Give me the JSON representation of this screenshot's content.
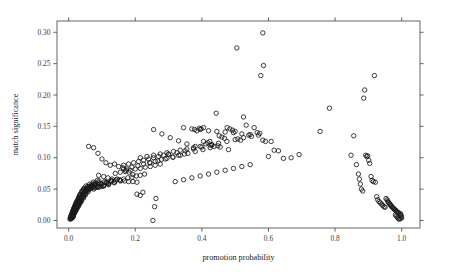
{
  "figure": {
    "background_color": "#ffffff",
    "frame_color": "#555555",
    "point_color": "#1a1a1a",
    "width": 449,
    "height": 278
  },
  "chart_data": {
    "type": "scatter",
    "title": "",
    "subtitle": "",
    "xlabel": "promotion probability",
    "ylabel": "match significance",
    "xlim": [
      -0.035,
      1.055
    ],
    "ylim": [
      -0.012,
      0.318
    ],
    "xticks": [
      0.0,
      0.2,
      0.4,
      0.6,
      0.8,
      1.0
    ],
    "xticklabels": [
      "0.0",
      "0.2",
      "0.4",
      "0.6",
      "0.8",
      "1.0"
    ],
    "yticks": [
      0.0,
      0.05,
      0.1,
      0.15,
      0.2,
      0.25,
      0.3
    ],
    "yticklabels": [
      "0.00",
      "0.05",
      "0.10",
      "0.15",
      "0.20",
      "0.25",
      "0.30"
    ],
    "grid": false,
    "legend": null,
    "marker": "open-circle",
    "marker_size_px": 4.4,
    "frame": "box-all-sides",
    "ticks_on_all_sides": true,
    "annotations": [],
    "series": [
      {
        "name": "matches",
        "x": [
          0.004,
          0.006,
          0.007,
          0.008,
          0.009,
          0.01,
          0.011,
          0.012,
          0.013,
          0.014,
          0.005,
          0.006,
          0.008,
          0.009,
          0.01,
          0.011,
          0.012,
          0.013,
          0.015,
          0.016,
          0.007,
          0.009,
          0.01,
          0.011,
          0.013,
          0.014,
          0.016,
          0.017,
          0.018,
          0.019,
          0.008,
          0.01,
          0.012,
          0.013,
          0.015,
          0.016,
          0.018,
          0.019,
          0.021,
          0.022,
          0.01,
          0.012,
          0.014,
          0.015,
          0.017,
          0.019,
          0.02,
          0.022,
          0.024,
          0.025,
          0.012,
          0.014,
          0.016,
          0.018,
          0.02,
          0.022,
          0.024,
          0.026,
          0.028,
          0.03,
          0.014,
          0.017,
          0.019,
          0.021,
          0.023,
          0.026,
          0.028,
          0.03,
          0.032,
          0.034,
          0.016,
          0.019,
          0.022,
          0.024,
          0.027,
          0.029,
          0.032,
          0.034,
          0.036,
          0.039,
          0.019,
          0.022,
          0.025,
          0.028,
          0.031,
          0.034,
          0.036,
          0.039,
          0.042,
          0.045,
          0.022,
          0.026,
          0.029,
          0.032,
          0.035,
          0.039,
          0.042,
          0.045,
          0.048,
          0.051,
          0.026,
          0.03,
          0.033,
          0.037,
          0.041,
          0.044,
          0.048,
          0.052,
          0.055,
          0.059,
          0.03,
          0.034,
          0.039,
          0.043,
          0.047,
          0.051,
          0.055,
          0.06,
          0.064,
          0.068,
          0.035,
          0.04,
          0.045,
          0.05,
          0.055,
          0.06,
          0.064,
          0.069,
          0.074,
          0.079,
          0.04,
          0.046,
          0.052,
          0.057,
          0.063,
          0.069,
          0.074,
          0.08,
          0.086,
          0.091,
          0.046,
          0.053,
          0.059,
          0.066,
          0.072,
          0.079,
          0.085,
          0.092,
          0.098,
          0.105,
          0.053,
          0.06,
          0.068,
          0.075,
          0.083,
          0.09,
          0.098,
          0.105,
          0.113,
          0.12,
          0.061,
          0.069,
          0.078,
          0.086,
          0.095,
          0.103,
          0.112,
          0.12,
          0.129,
          0.137,
          0.07,
          0.079,
          0.089,
          0.098,
          0.108,
          0.118,
          0.127,
          0.137,
          0.146,
          0.156,
          0.06,
          0.075,
          0.088,
          0.1,
          0.112,
          0.125,
          0.138,
          0.15,
          0.163,
          0.175,
          0.09,
          0.105,
          0.118,
          0.13,
          0.143,
          0.155,
          0.168,
          0.18,
          0.193,
          0.205,
          0.115,
          0.128,
          0.14,
          0.153,
          0.165,
          0.178,
          0.19,
          0.203,
          0.215,
          0.228,
          0.14,
          0.155,
          0.17,
          0.185,
          0.2,
          0.215,
          0.23,
          0.245,
          0.26,
          0.275,
          0.165,
          0.18,
          0.195,
          0.21,
          0.225,
          0.24,
          0.255,
          0.27,
          0.285,
          0.3,
          0.19,
          0.208,
          0.225,
          0.243,
          0.26,
          0.278,
          0.295,
          0.313,
          0.33,
          0.348,
          0.215,
          0.235,
          0.255,
          0.275,
          0.295,
          0.315,
          0.335,
          0.355,
          0.375,
          0.395,
          0.245,
          0.268,
          0.29,
          0.313,
          0.335,
          0.358,
          0.38,
          0.403,
          0.425,
          0.448,
          0.255,
          0.28,
          0.305,
          0.33,
          0.355,
          0.38,
          0.405,
          0.43,
          0.455,
          0.48,
          0.3,
          0.325,
          0.35,
          0.375,
          0.4,
          0.425,
          0.45,
          0.475,
          0.5,
          0.525,
          0.32,
          0.345,
          0.37,
          0.395,
          0.42,
          0.445,
          0.47,
          0.495,
          0.52,
          0.545,
          0.345,
          0.37,
          0.395,
          0.42,
          0.445,
          0.47,
          0.495,
          0.52,
          0.545,
          0.57,
          0.253,
          0.258,
          0.262,
          0.205,
          0.215,
          0.223,
          0.165,
          0.172,
          0.181,
          0.193,
          0.378,
          0.385,
          0.392,
          0.398,
          0.405,
          0.412,
          0.418,
          0.424,
          0.43,
          0.437,
          0.443,
          0.452,
          0.46,
          0.468,
          0.476,
          0.484,
          0.492,
          0.5,
          0.508,
          0.516,
          0.525,
          0.533,
          0.541,
          0.549,
          0.557,
          0.566,
          0.574,
          0.583,
          0.591,
          0.6,
          0.608,
          0.617,
          0.63,
          0.645,
          0.668,
          0.692,
          0.505,
          0.583,
          0.585,
          0.577,
          0.755,
          0.783,
          0.848,
          0.856,
          0.864,
          0.87,
          0.873,
          0.876,
          0.879,
          0.883,
          0.886,
          0.889,
          0.892,
          0.895,
          0.898,
          0.901,
          0.904,
          0.908,
          0.911,
          0.915,
          0.918,
          0.921,
          0.925,
          0.928,
          0.932,
          0.936,
          0.94,
          0.943,
          0.947,
          0.95,
          0.953,
          0.956,
          0.958,
          0.96,
          0.962,
          0.964,
          0.966,
          0.968,
          0.97,
          0.972,
          0.974,
          0.976,
          0.978,
          0.98,
          0.982,
          0.984,
          0.986,
          0.988,
          0.991,
          0.995,
          0.997,
          0.998,
          0.999,
          1.0,
          0.996,
          0.993,
          0.99,
          0.987,
          0.984,
          0.981
        ],
        "y": [
          0.002,
          0.003,
          0.004,
          0.003,
          0.005,
          0.004,
          0.006,
          0.005,
          0.007,
          0.006,
          0.004,
          0.006,
          0.005,
          0.008,
          0.007,
          0.009,
          0.008,
          0.01,
          0.009,
          0.011,
          0.006,
          0.008,
          0.01,
          0.009,
          0.012,
          0.011,
          0.013,
          0.012,
          0.014,
          0.013,
          0.009,
          0.011,
          0.013,
          0.012,
          0.015,
          0.014,
          0.016,
          0.015,
          0.017,
          0.016,
          0.011,
          0.014,
          0.016,
          0.015,
          0.018,
          0.017,
          0.019,
          0.018,
          0.02,
          0.019,
          0.014,
          0.017,
          0.019,
          0.018,
          0.021,
          0.02,
          0.022,
          0.021,
          0.024,
          0.023,
          0.017,
          0.02,
          0.022,
          0.021,
          0.024,
          0.023,
          0.026,
          0.025,
          0.028,
          0.027,
          0.02,
          0.023,
          0.026,
          0.025,
          0.028,
          0.027,
          0.03,
          0.029,
          0.032,
          0.031,
          0.024,
          0.027,
          0.03,
          0.029,
          0.032,
          0.031,
          0.035,
          0.034,
          0.037,
          0.036,
          0.028,
          0.031,
          0.034,
          0.033,
          0.037,
          0.036,
          0.039,
          0.038,
          0.042,
          0.041,
          0.032,
          0.036,
          0.039,
          0.038,
          0.042,
          0.041,
          0.045,
          0.044,
          0.047,
          0.046,
          0.037,
          0.041,
          0.044,
          0.043,
          0.047,
          0.046,
          0.05,
          0.049,
          0.053,
          0.052,
          0.042,
          0.046,
          0.05,
          0.049,
          0.053,
          0.052,
          0.055,
          0.054,
          0.058,
          0.057,
          0.047,
          0.051,
          0.055,
          0.054,
          0.058,
          0.057,
          0.061,
          0.06,
          0.064,
          0.063,
          0.05,
          0.05,
          0.05,
          0.051,
          0.052,
          0.052,
          0.053,
          0.054,
          0.054,
          0.055,
          0.048,
          0.052,
          0.054,
          0.05,
          0.056,
          0.053,
          0.058,
          0.055,
          0.06,
          0.057,
          0.052,
          0.055,
          0.057,
          0.054,
          0.059,
          0.056,
          0.061,
          0.058,
          0.063,
          0.06,
          0.055,
          0.058,
          0.06,
          0.057,
          0.062,
          0.059,
          0.064,
          0.061,
          0.066,
          0.063,
          0.118,
          0.116,
          0.107,
          0.098,
          0.092,
          0.088,
          0.09,
          0.086,
          0.084,
          0.082,
          0.072,
          0.07,
          0.068,
          0.066,
          0.065,
          0.064,
          0.063,
          0.062,
          0.062,
          0.061,
          0.06,
          0.062,
          0.063,
          0.065,
          0.066,
          0.068,
          0.069,
          0.071,
          0.072,
          0.074,
          0.075,
          0.077,
          0.078,
          0.08,
          0.082,
          0.083,
          0.085,
          0.086,
          0.088,
          0.09,
          0.088,
          0.09,
          0.092,
          0.094,
          0.096,
          0.098,
          0.1,
          0.102,
          0.104,
          0.106,
          0.085,
          0.087,
          0.09,
          0.092,
          0.094,
          0.097,
          0.099,
          0.101,
          0.104,
          0.106,
          0.1,
          0.102,
          0.104,
          0.106,
          0.108,
          0.11,
          0.112,
          0.114,
          0.116,
          0.118,
          0.092,
          0.095,
          0.098,
          0.101,
          0.104,
          0.107,
          0.11,
          0.113,
          0.116,
          0.119,
          0.145,
          0.138,
          0.132,
          0.127,
          0.122,
          0.118,
          0.126,
          0.121,
          0.117,
          0.113,
          0.105,
          0.108,
          0.111,
          0.114,
          0.117,
          0.12,
          0.123,
          0.126,
          0.129,
          0.132,
          0.062,
          0.065,
          0.068,
          0.071,
          0.074,
          0.077,
          0.08,
          0.083,
          0.086,
          0.089,
          0.148,
          0.146,
          0.145,
          0.143,
          0.142,
          0.141,
          0.14,
          0.138,
          0.137,
          0.136,
          0.0,
          0.022,
          0.035,
          0.042,
          0.04,
          0.045,
          0.082,
          0.08,
          0.077,
          0.073,
          0.145,
          0.143,
          0.147,
          0.146,
          0.148,
          0.122,
          0.124,
          0.126,
          0.12,
          0.118,
          0.171,
          0.135,
          0.133,
          0.131,
          0.148,
          0.146,
          0.144,
          0.142,
          0.13,
          0.128,
          0.165,
          0.152,
          0.136,
          0.134,
          0.148,
          0.14,
          0.139,
          0.128,
          0.126,
          0.102,
          0.126,
          0.112,
          0.111,
          0.099,
          0.1,
          0.105,
          0.275,
          0.299,
          0.247,
          0.231,
          0.142,
          0.179,
          0.104,
          0.135,
          0.089,
          0.074,
          0.066,
          0.058,
          0.05,
          0.047,
          0.195,
          0.208,
          0.104,
          0.102,
          0.103,
          0.096,
          0.091,
          0.07,
          0.064,
          0.062,
          0.231,
          0.061,
          0.038,
          0.033,
          0.03,
          0.028,
          0.026,
          0.024,
          0.022,
          0.021,
          0.035,
          0.033,
          0.031,
          0.029,
          0.028,
          0.026,
          0.025,
          0.024,
          0.022,
          0.021,
          0.02,
          0.019,
          0.018,
          0.017,
          0.016,
          0.015,
          0.014,
          0.013,
          0.012,
          0.011,
          0.01,
          0.008,
          0.006,
          0.004,
          0.003,
          0.002,
          0.003,
          0.005,
          0.007,
          0.009
        ]
      }
    ]
  }
}
